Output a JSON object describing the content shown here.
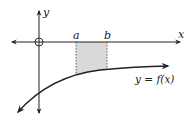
{
  "diagram": {
    "type": "integral-area-illustration",
    "axes": {
      "x_label": "x",
      "y_label": "y",
      "origin_marker": "circle"
    },
    "interval": {
      "a_label": "a",
      "b_label": "b",
      "shaded_fill": "#d9d9d9"
    },
    "curve": {
      "label": "y = f(x)",
      "description": "increasing concave-down curve below the x-axis, approaching the x-axis from below"
    },
    "colors": {
      "axis": "#222222",
      "curve": "#222222",
      "shade": "#d9d9d9",
      "dashed": "#555555"
    }
  }
}
